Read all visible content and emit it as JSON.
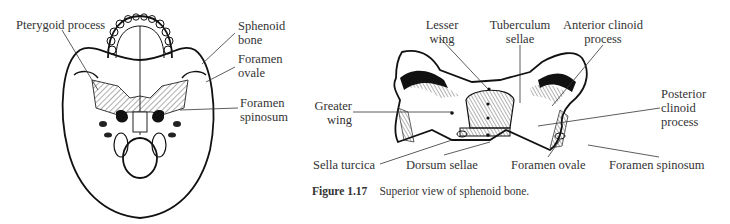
{
  "figure_left": {
    "title": "Inferior view of skull",
    "labels": {
      "pterygoid_process": "Pterygoid process",
      "sphenoid_bone": [
        "Sphenoid",
        "bone"
      ],
      "foramen_ovale": [
        "Foramen",
        "ovale"
      ],
      "foramen_spinosum": [
        "Foramen",
        "spinosum"
      ]
    }
  },
  "figure_right": {
    "labels": {
      "lesser_wing": [
        "Lesser",
        "wing"
      ],
      "tuberculum_sellae": [
        "Tuberculum",
        "sellae"
      ],
      "anterior_clinoid_process": [
        "Anterior clinoid",
        "process"
      ],
      "posterior_clinoid_process": [
        "Posterior",
        "clinoid",
        "process"
      ],
      "greater_wing": [
        "Greater",
        "wing"
      ],
      "sella_turcica": "Sella turcica",
      "dorsum_sellae": "Dorsum sellae",
      "foramen_ovale": "Foramen ovale",
      "foramen_spinosum": "Foramen spinosum"
    },
    "caption": {
      "number": "Figure 1.17",
      "text": "Superior view of sphenoid bone."
    }
  }
}
